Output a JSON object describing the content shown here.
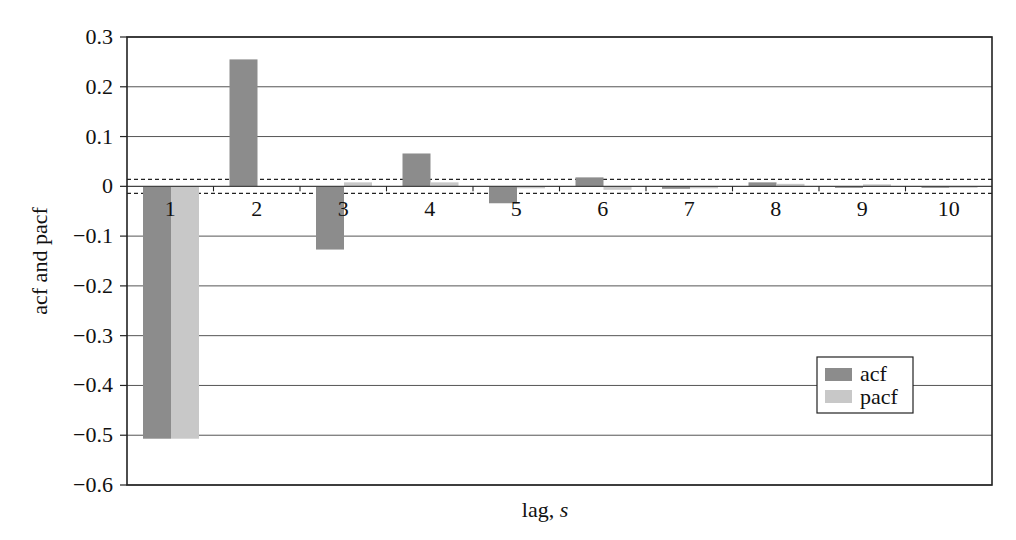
{
  "chart_data": {
    "type": "bar",
    "title": "",
    "xlabel": "lag, s",
    "xlabel_main": "lag, ",
    "xlabel_italic": "s",
    "ylabel": "acf and pacf",
    "categories": [
      "1",
      "2",
      "3",
      "4",
      "5",
      "6",
      "7",
      "8",
      "9",
      "10"
    ],
    "series": [
      {
        "name": "acf",
        "color": "#8c8c8c",
        "values": [
          -0.507,
          0.255,
          -0.127,
          0.066,
          -0.034,
          0.018,
          -0.005,
          0.008,
          -0.003,
          -0.003
        ]
      },
      {
        "name": "pacf",
        "color": "#c8c8c8",
        "values": [
          -0.507,
          0.0,
          0.008,
          0.008,
          -0.004,
          -0.007,
          -0.004,
          0.005,
          0.004,
          -0.003
        ]
      }
    ],
    "ylim": [
      -0.6,
      0.3
    ],
    "yticks": [
      0.3,
      0.2,
      0.1,
      0,
      -0.1,
      -0.2,
      -0.3,
      -0.4,
      -0.5,
      -0.6
    ],
    "ytick_labels": [
      "0.3",
      "0.2",
      "0.1",
      "0",
      "−0.1",
      "−0.2",
      "−0.3",
      "−0.4",
      "−0.5",
      "−0.6"
    ],
    "confidence_bounds": [
      0.014,
      -0.014
    ],
    "grid": true,
    "legend_position": "lower right"
  }
}
